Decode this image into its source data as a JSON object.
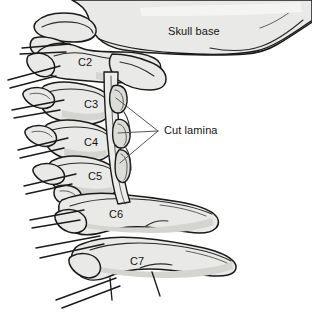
{
  "figure": {
    "background_color": "#ffffff",
    "bone_fill_color": "#e9e9e7",
    "bone_shade_color": "#d4d4d1",
    "outline_color": "#1a1a1a",
    "leader_color": "#555555",
    "label_color": "#141414",
    "width": 312,
    "height": 318
  },
  "labels": {
    "skull_base": "Skull base",
    "cut_lamina": "Cut lamina",
    "c2": "C2",
    "c3": "C3",
    "c4": "C4",
    "c5": "C5",
    "c6": "C6",
    "c7": "C7"
  },
  "label_positions": {
    "skull_base": {
      "x": 168,
      "y": 26
    },
    "cut_lamina": {
      "x": 164,
      "y": 125
    },
    "c2": {
      "x": 78,
      "y": 57
    },
    "c3": {
      "x": 84,
      "y": 99
    },
    "c4": {
      "x": 84,
      "y": 137
    },
    "c5": {
      "x": 88,
      "y": 171
    },
    "c6": {
      "x": 109,
      "y": 209
    },
    "c7": {
      "x": 130,
      "y": 256
    }
  },
  "annotations": {
    "leader_apex": {
      "x": 158,
      "y": 131
    },
    "leader_targets": [
      {
        "x": 116,
        "y": 98
      },
      {
        "x": 118,
        "y": 133
      },
      {
        "x": 120,
        "y": 163
      }
    ]
  },
  "structures": [
    {
      "name": "skull-base",
      "label": "Skull base"
    },
    {
      "name": "vertebra-c2",
      "label": "C2"
    },
    {
      "name": "vertebra-c3",
      "label": "C3"
    },
    {
      "name": "vertebra-c4",
      "label": "C4"
    },
    {
      "name": "vertebra-c5",
      "label": "C5"
    },
    {
      "name": "vertebra-c6",
      "label": "C6"
    },
    {
      "name": "vertebra-c7",
      "label": "C7"
    },
    {
      "name": "cut-lamina-fragments",
      "label": "Cut lamina"
    },
    {
      "name": "spinal-canal",
      "label": ""
    },
    {
      "name": "nerve-roots",
      "label": ""
    }
  ]
}
